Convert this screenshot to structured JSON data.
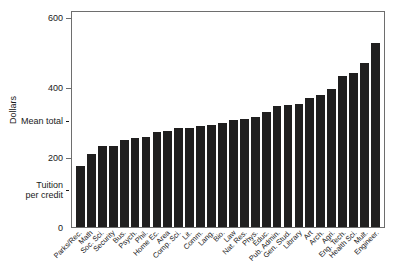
{
  "chart_data": {
    "type": "bar",
    "title": "",
    "xlabel": "",
    "ylabel": "Dollars",
    "ylim": [
      0,
      620
    ],
    "grid": false,
    "legend": null,
    "categories": [
      "Parks/Rec.",
      "Math",
      "Soc. Sci.",
      "Security",
      "Bus.",
      "Psych.",
      "Phil.",
      "Home Ec.",
      "Area",
      "Comp. Sci.",
      "Lit.",
      "Comm.",
      "Lang.",
      "Bio.",
      "Law",
      "Nat. Res.",
      "Phys.",
      "Educ.",
      "Pub. Admin.",
      "Gen. Stud.",
      "Library",
      "Art",
      "Arch.",
      "Agri.",
      "Eng. Tech.",
      "Health Sci.",
      "Mult.",
      "Engineer."
    ],
    "values": [
      175,
      208,
      232,
      232,
      248,
      253,
      256,
      272,
      275,
      283,
      283,
      288,
      292,
      297,
      305,
      310,
      313,
      330,
      345,
      350,
      352,
      370,
      378,
      395,
      432,
      440,
      470,
      525
    ],
    "annotations": [
      {
        "label": "Mean total",
        "value": 305,
        "style": "dashed"
      },
      {
        "label": "Tuition per credit",
        "value": 110,
        "style": "dashed"
      }
    ],
    "yticks": [
      {
        "label": "600",
        "value": 600
      },
      {
        "label": "400",
        "value": 400
      },
      {
        "label": "200",
        "value": 200
      },
      {
        "label": "0",
        "value": 0
      }
    ]
  },
  "axis": {
    "y_title": "Dollars",
    "tick_600": "600",
    "tick_400": "400",
    "tick_200": "200",
    "tick_0": "0",
    "ref_mean": "Mean total",
    "ref_tuition_line1": "Tuition",
    "ref_tuition_line2": "per credit"
  }
}
